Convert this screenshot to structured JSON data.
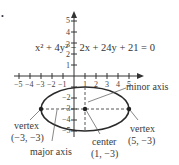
{
  "bullet": "•",
  "equation": "x² + 4y² − 2x + 24y + 21 = 0",
  "axes": {
    "x_ticks": [
      "−5",
      "−4",
      "−3",
      "−2",
      "−1",
      "1",
      "2",
      "3",
      "4",
      "5"
    ],
    "y_ticks_pos": [
      "5",
      "4",
      "3",
      "2",
      "1"
    ],
    "y_ticks_neg": [
      "−2",
      "−3",
      "−4",
      "−5"
    ]
  },
  "ellipse": {
    "center": [
      1,
      -3
    ],
    "a": 4,
    "b": 2
  },
  "labels": {
    "minor_axis": "minor axis",
    "major_axis": "major axis",
    "vertex_left_word": "vertex",
    "vertex_left_coords": "(−3, −3)",
    "vertex_right_word": "vertex",
    "vertex_right_coords": "(5, −3)",
    "center_word": "center",
    "center_coords": "(1, −3)"
  },
  "colors": {
    "line": "#2a2a2a",
    "text": "#3a3a3a"
  }
}
